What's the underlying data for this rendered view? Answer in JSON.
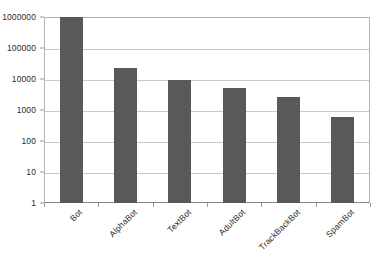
{
  "chart_data": {
    "type": "bar",
    "title": "",
    "subtitle": "",
    "xlabel": "",
    "ylabel": "",
    "categories": [
      "Bot",
      "AlphaBot",
      "TextBot",
      "AdultBot",
      "TrackBackBot",
      "SpamBot"
    ],
    "values": [
      1000000,
      22000,
      9300,
      5100,
      2600,
      590
    ],
    "yscale": "log",
    "ylim": [
      1,
      1000000
    ],
    "y_ticks": [
      1,
      10,
      100,
      1000,
      10000,
      100000,
      1000000
    ],
    "y_tick_labels": [
      "1",
      "10",
      "100",
      "1000",
      "10000",
      "100000",
      "1000000"
    ],
    "grid": true,
    "grid_axis": "y",
    "legend": false,
    "legend_position": "none",
    "bar_color": "#595959",
    "gridline_color": "#c9c9c9",
    "plot_border_color": "#b3b3b3",
    "axis_color": "#868686",
    "text_color": "#2b2b2b",
    "background_color": "#ffffff",
    "xtick_label_rotation": -45,
    "annotations": []
  }
}
